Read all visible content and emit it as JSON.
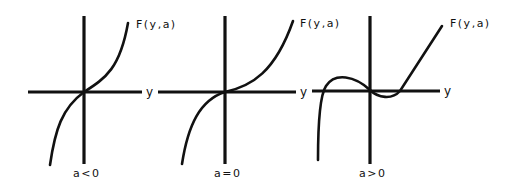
{
  "figure": {
    "panels": [
      {
        "id": "a-negative",
        "function_label": "F(y,a)",
        "x_axis_label": "y",
        "condition_label": "a<0",
        "shape": "monotonic increasing cubic, single root at origin"
      },
      {
        "id": "a-zero",
        "function_label": "F(y,a)",
        "x_axis_label": "y",
        "condition_label": "a=0",
        "shape": "monotonic cubic with inflection (flat tangent) at origin"
      },
      {
        "id": "a-positive",
        "function_label": "F(y,a)",
        "x_axis_label": "y",
        "condition_label": "a>0",
        "shape": "cubic with three roots: negative root, origin, positive root"
      }
    ],
    "colors": {
      "ink": "#111111",
      "background": "#ffffff"
    }
  }
}
